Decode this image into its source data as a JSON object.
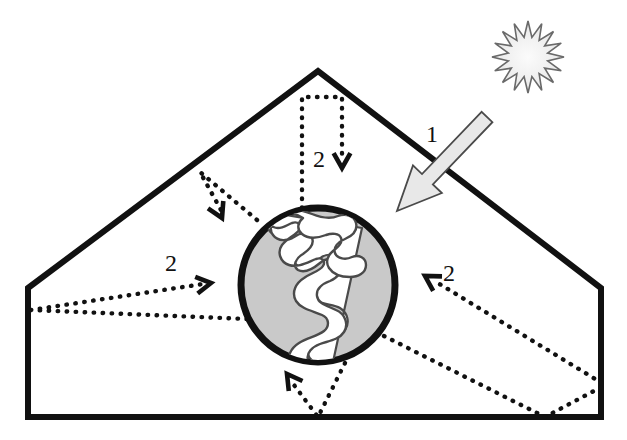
{
  "diagram": {
    "canvas": {
      "width": 627,
      "height": 440,
      "background": "#ffffff"
    },
    "colors": {
      "outline": "#111111",
      "globe_fill": "#c9c9c9",
      "globe_outline": "#111111",
      "land_fill": "#ffffff",
      "land_outline": "#3a3a3a",
      "arrow_fill": "#e8e8e8",
      "arrow_outline": "#4a4a4a",
      "sun_fill": "#f2f2f2",
      "sun_outline": "#6a6a6a",
      "ray_dotted": "#111111"
    },
    "labels": [
      {
        "id": "incoming-solar",
        "text": "1",
        "x": 432,
        "y": 142
      },
      {
        "id": "reflected-top",
        "text": "2",
        "x": 319,
        "y": 167
      },
      {
        "id": "reflected-left",
        "text": "2",
        "x": 171,
        "y": 271
      },
      {
        "id": "reflected-right",
        "text": "2",
        "x": 449,
        "y": 281
      }
    ],
    "enclosure": {
      "name": "atmosphere-boundary",
      "points": "28,288 318,71 601,288 601,417 28,417",
      "stroke_width": 6
    },
    "globe": {
      "name": "earth-globe",
      "cx": 318,
      "cy": 285,
      "r": 77,
      "stroke_width": 7
    },
    "sun": {
      "name": "sun-starburst",
      "cx": 528,
      "cy": 57,
      "outer_r": 36,
      "inner_r": 20,
      "points": 16
    },
    "solar_arrow": {
      "name": "incoming-solar-arrow",
      "from": [
        487,
        117
      ],
      "to": [
        397,
        211
      ],
      "shaft_width": 15,
      "head_width": 40,
      "head_length": 44
    },
    "rays": [
      {
        "id": "ray-top",
        "label": "2",
        "path": "302,208 302,97 342,97 342,160",
        "arrow_at": [
          342,
          168
        ],
        "arrow_dir": "down"
      },
      {
        "id": "ray-upper-left",
        "label": "2",
        "path": "257,220 200,172 221,210",
        "arrow_at": [
          222,
          218
        ],
        "arrow_dir": "down-right"
      },
      {
        "id": "ray-left",
        "label": "2",
        "path": "247,319 31,310 203,284",
        "arrow_at": [
          211,
          283
        ],
        "arrow_dir": "right-up"
      },
      {
        "id": "ray-right",
        "label": "2",
        "path": "384,336 545,417 605,385 433,280",
        "arrow_at": [
          425,
          276
        ],
        "arrow_dir": "left-up"
      },
      {
        "id": "ray-bottom",
        "label": "",
        "path": "349,355 318,417 291,381",
        "arrow_at": [
          287,
          374
        ],
        "arrow_dir": "up-left"
      }
    ]
  }
}
